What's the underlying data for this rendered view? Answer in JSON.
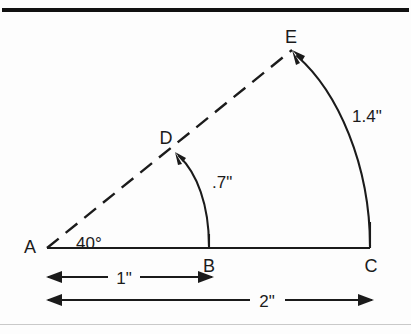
{
  "figure": {
    "type": "geometry-diagram",
    "background_color": "#fdfdfd",
    "ink_color": "#1b1b1b",
    "points": [
      {
        "id": "A",
        "label": "A",
        "x": 47,
        "y": 248,
        "label_x": 30,
        "label_y": 246
      },
      {
        "id": "B",
        "label": "B",
        "x": 209,
        "y": 248,
        "label_x": 205,
        "label_y": 267
      },
      {
        "id": "C",
        "label": "C",
        "x": 370,
        "y": 248,
        "label_x": 366,
        "label_y": 267
      },
      {
        "id": "D",
        "label": "D",
        "x": 175,
        "y": 152,
        "label_x": 160,
        "label_y": 139
      },
      {
        "id": "E",
        "label": "E",
        "x": 292,
        "y": 50,
        "label_x": 286,
        "label_y": 38
      }
    ],
    "angle": {
      "vertex": "A",
      "label": "40°",
      "value": 40,
      "unit": "degrees",
      "label_x": 70,
      "label_y": 248
    },
    "arcs": [
      {
        "name": "arc-b-to-d",
        "from": "B",
        "to": "D",
        "label": ".7\"",
        "value": 0.7,
        "unit": "inches",
        "label_x": 212,
        "label_y": 187
      },
      {
        "name": "arc-c-to-e",
        "from": "C",
        "to": "E",
        "label": "1.4\"",
        "value": 1.4,
        "unit": "inches",
        "label_x": 352,
        "label_y": 122
      }
    ],
    "dimensions": [
      {
        "name": "dimension-1-inch",
        "label": "1\"",
        "value": 1,
        "unit": "inches",
        "from_x": 48,
        "to_x": 212,
        "y": 277,
        "label_x": 112,
        "label_y": 284,
        "spans": "A to B"
      },
      {
        "name": "dimension-2-inch",
        "label": "2\"",
        "value": 2,
        "unit": "inches",
        "from_x": 48,
        "to_x": 372,
        "y": 300,
        "label_x": 255,
        "label_y": 307,
        "spans": "A to C"
      }
    ],
    "baseline": {
      "name": "baseline-a-to-c",
      "from": "A",
      "to": "C"
    },
    "ray": {
      "name": "ray-a-through-d-to-e",
      "from": "A",
      "through": "D",
      "to": "E",
      "style": "dashed"
    }
  }
}
